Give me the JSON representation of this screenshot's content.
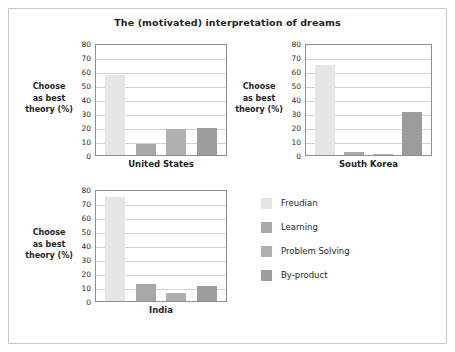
{
  "chart_data": {
    "type": "bar",
    "title": "The (motivated) interpretation of dreams",
    "xlabel": "",
    "ylabel": "Choose as best theory (%)",
    "ylim": [
      0,
      80
    ],
    "ytick_step": 10,
    "yticks": [
      80,
      70,
      60,
      50,
      40,
      30,
      20,
      10,
      0
    ],
    "grid": true,
    "legend_position": "bottom-right",
    "categories": [
      "Freudian",
      "Learning",
      "Problem Solving",
      "By-product"
    ],
    "panels": [
      {
        "name": "United States",
        "values": [
          57,
          8,
          18.5,
          19
        ],
        "ylabel": "Choose\nas best\ntheory (%)"
      },
      {
        "name": "South Korea",
        "values": [
          64.5,
          2.5,
          1,
          30.5
        ],
        "ylabel": "Choose\nas best\ntheory (%)"
      },
      {
        "name": "India",
        "values": [
          74,
          12.5,
          6,
          10.5
        ],
        "ylabel": "Choose\nas best\ntheory (%)"
      }
    ],
    "series_colors": [
      "#e6e6e6",
      "#a8a8a8",
      "#b0b0b0",
      "#9c9c9c"
    ]
  },
  "title": "The (motivated) interpretation of dreams",
  "axis_label_lines": [
    "Choose",
    "as best",
    "theory (%)"
  ],
  "panels": {
    "us": {
      "name": "United States"
    },
    "kr": {
      "name": "South Korea"
    },
    "in": {
      "name": "India"
    }
  },
  "legend": {
    "items": [
      {
        "label": "Freudian",
        "color": "#e6e6e6"
      },
      {
        "label": "Learning",
        "color": "#a8a8a8"
      },
      {
        "label": "Problem Solving",
        "color": "#b0b0b0"
      },
      {
        "label": "By-product",
        "color": "#9c9c9c"
      }
    ]
  },
  "colors": {
    "frame": "#c9c9c9",
    "plot_border": "#8f8f8f",
    "gridline": "#d2d2d2",
    "text": "#1f1f1f",
    "background": "#ffffff"
  }
}
